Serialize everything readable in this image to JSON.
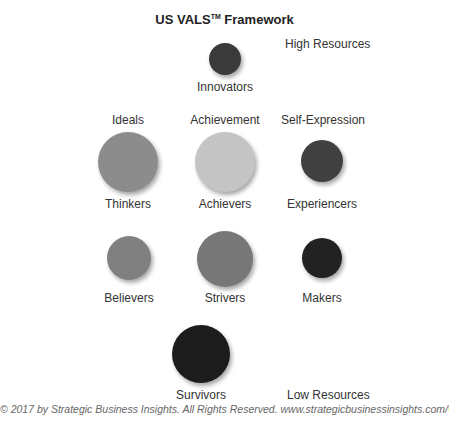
{
  "title": {
    "text": "US VALS",
    "trademark": "TM",
    "suffix": " Framework"
  },
  "axis": {
    "high": "High Resources",
    "low": "Low Resources"
  },
  "motivations": [
    {
      "label": "Ideals",
      "x": 128,
      "y": 113
    },
    {
      "label": "Achievement",
      "x": 225,
      "y": 113
    },
    {
      "label": "Self-Expression",
      "x": 323,
      "y": 113
    }
  ],
  "segments": [
    {
      "name": "Innovators",
      "cx": 225,
      "cy": 59,
      "r": 16,
      "color": "#3a3a3a",
      "label_y": 80
    },
    {
      "name": "Thinkers",
      "cx": 128,
      "cy": 162,
      "r": 30,
      "color": "#8c8c8c",
      "label_y": 197
    },
    {
      "name": "Achievers",
      "cx": 225,
      "cy": 162,
      "r": 30,
      "color": "#c4c4c4",
      "label_y": 197
    },
    {
      "name": "Experiencers",
      "cx": 322,
      "cy": 161,
      "r": 21,
      "color": "#404040",
      "label_y": 197
    },
    {
      "name": "Believers",
      "cx": 129,
      "cy": 258,
      "r": 22,
      "color": "#808080",
      "label_y": 291
    },
    {
      "name": "Strivers",
      "cx": 225,
      "cy": 259,
      "r": 28,
      "color": "#777777",
      "label_y": 291
    },
    {
      "name": "Makers",
      "cx": 322,
      "cy": 258,
      "r": 20,
      "color": "#222222",
      "label_y": 291
    },
    {
      "name": "Survivors",
      "cx": 201,
      "cy": 354,
      "r": 29,
      "color": "#1c1c1c",
      "label_y": 388
    }
  ],
  "footer": "© 2017 by Strategic Business Insights. All Rights Reserved. www.strategicbusinessinsights.com/vals"
}
